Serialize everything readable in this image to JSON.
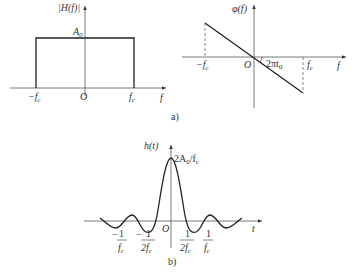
{
  "figure_a": {
    "caption": "a)",
    "magnitude": {
      "ylabel": "|H(f)|",
      "xlabel": "f",
      "level_label": "A",
      "level_sub": "0",
      "neg_cutoff": "−f",
      "pos_cutoff": "f",
      "cutoff_sub": "c",
      "origin": "O"
    },
    "phase": {
      "ylabel": "φ(f)",
      "xlabel": "f",
      "neg_cutoff": "−f",
      "pos_cutoff": "f",
      "cutoff_sub": "c",
      "origin": "O",
      "slope_label": "2πt",
      "slope_sub": "0"
    }
  },
  "figure_b": {
    "caption": "b)",
    "ylabel": "h(t)",
    "xlabel": "t",
    "peak_label": "2A",
    "peak_sub": "0",
    "peak_tail": "/f",
    "peak_tail_sub": "c",
    "origin": "O",
    "ticks": [
      {
        "sign": "−",
        "num": "1",
        "den": "f",
        "den_sub": "c"
      },
      {
        "sign": "−",
        "num": "1",
        "den": "2f",
        "den_sub": "c"
      },
      {
        "sign": "",
        "num": "1",
        "den": "2f",
        "den_sub": "c"
      },
      {
        "sign": "",
        "num": "1",
        "den": "f",
        "den_sub": "c"
      }
    ]
  }
}
